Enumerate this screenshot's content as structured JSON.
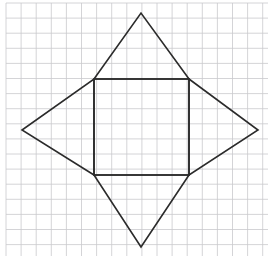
{
  "figure": {
    "background_color": "#ffffff",
    "canvas": {
      "width": 273,
      "height": 270
    },
    "grid": {
      "visible": true,
      "line_color": "#c9c9cd",
      "line_width": 0.8,
      "cell_size": 15.1,
      "origin_x": 6,
      "origin_y": 3,
      "columns": 17,
      "rows": 17,
      "right_edge": 268,
      "bottom_edge": 256
    },
    "stroke": {
      "color": "#2b2b2b",
      "width": 1.6,
      "fill": "none"
    },
    "shapes": [
      {
        "name": "inner-square",
        "type": "polygon",
        "points": "94,79 189,79 189,175 94,175",
        "vertex_labels": [
          "top-left",
          "top-right",
          "bottom-right",
          "bottom-left"
        ]
      },
      {
        "name": "top-triangle",
        "type": "polygon",
        "points": "94,79 141,13 189,79"
      },
      {
        "name": "right-triangle",
        "type": "polygon",
        "points": "189,79 258,130 189,175"
      },
      {
        "name": "bottom-triangle",
        "type": "polygon",
        "points": "189,175 141,247 94,175"
      },
      {
        "name": "left-triangle",
        "type": "polygon",
        "points": "94,175 22,130 94,79"
      }
    ],
    "star_outline": {
      "name": "star-outline",
      "points": "141,13 189,79 258,130 189,175 141,247 94,175 22,130 94,79"
    },
    "key_points": {
      "top_apex": {
        "x": 141,
        "y": 13
      },
      "right_apex": {
        "x": 258,
        "y": 130
      },
      "bottom_apex": {
        "x": 141,
        "y": 247
      },
      "left_apex": {
        "x": 22,
        "y": 130
      },
      "square_top_left": {
        "x": 94,
        "y": 79
      },
      "square_top_right": {
        "x": 189,
        "y": 79
      },
      "square_bottom_right": {
        "x": 189,
        "y": 175
      },
      "square_bottom_left": {
        "x": 94,
        "y": 175
      }
    }
  }
}
